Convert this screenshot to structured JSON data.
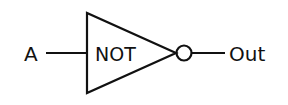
{
  "diagram": {
    "type": "logic-gate",
    "gate": {
      "label": "NOT"
    },
    "input": {
      "label": "A"
    },
    "output": {
      "label": "Out"
    },
    "stroke_color": "#111111"
  }
}
